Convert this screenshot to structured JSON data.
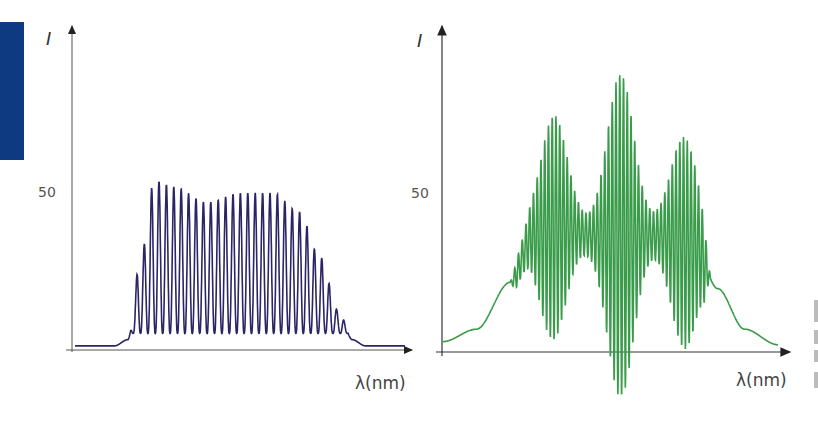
{
  "chart_data": [
    {
      "type": "line",
      "title": "",
      "xlabel": "λ(nm)",
      "ylabel": "I",
      "ytick_labels": [
        "50"
      ],
      "color": "#2b2566",
      "grid": false,
      "description": "Interference fringes under a flat-topped envelope; ~33 fringes, max near 55, modulation minima ~5",
      "envelope_points": [
        [
          0,
          1
        ],
        [
          0.12,
          1
        ],
        [
          0.16,
          3
        ],
        [
          0.2,
          30
        ],
        [
          0.24,
          54
        ],
        [
          0.3,
          52
        ],
        [
          0.4,
          47
        ],
        [
          0.5,
          50
        ],
        [
          0.6,
          50
        ],
        [
          0.68,
          44
        ],
        [
          0.74,
          30
        ],
        [
          0.8,
          12
        ],
        [
          0.84,
          3
        ],
        [
          0.88,
          1
        ],
        [
          1,
          1
        ]
      ],
      "fringe_count": 33,
      "ylim": [
        0,
        100
      ]
    },
    {
      "type": "line",
      "title": "",
      "xlabel": "λ(nm)",
      "ylabel": "I",
      "ytick_labels": [
        "50"
      ],
      "color": "#3a9c4a",
      "grid": false,
      "description": "Smooth rising edge, fringes with three beat maxima (peak ~85 at center), smooth falling edge",
      "base_points": [
        [
          0,
          3
        ],
        [
          0.1,
          7
        ],
        [
          0.2,
          22
        ],
        [
          0.27,
          37
        ],
        [
          0.35,
          40
        ],
        [
          0.45,
          37
        ],
        [
          0.55,
          37
        ],
        [
          0.65,
          37
        ],
        [
          0.75,
          34
        ],
        [
          0.82,
          20
        ],
        [
          0.9,
          7
        ],
        [
          1,
          2
        ]
      ],
      "beat_peaks": [
        {
          "x": 0.33,
          "amp": 32
        },
        {
          "x": 0.53,
          "amp": 48
        },
        {
          "x": 0.72,
          "amp": 30
        }
      ],
      "ylim": [
        0,
        100
      ]
    }
  ],
  "labels": {
    "left_y": "I",
    "left_tick": "50",
    "left_x": "λ(nm)",
    "right_y": "I",
    "right_tick": "50",
    "right_x": "λ(nm)"
  }
}
